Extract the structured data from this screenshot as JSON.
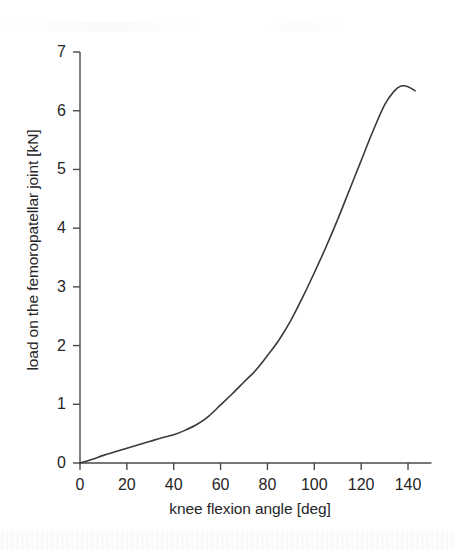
{
  "chart_data": {
    "type": "line",
    "title": "",
    "subtitle": "",
    "xlabel": "knee flexion angle [deg]",
    "ylabel": "load on the femoropatellar joint [kN]",
    "xlim": [
      0,
      150
    ],
    "ylim": [
      0,
      7
    ],
    "xticks": [
      0,
      20,
      40,
      60,
      80,
      100,
      120,
      140
    ],
    "yticks": [
      0,
      1,
      2,
      3,
      4,
      5,
      6,
      7
    ],
    "xtick_labels": [
      "0",
      "20",
      "40",
      "60",
      "80",
      "100",
      "120",
      "140"
    ],
    "ytick_labels": [
      "0",
      "1",
      "2",
      "3",
      "4",
      "5",
      "6",
      "7"
    ],
    "grid": false,
    "legend": false,
    "legend_position": "none",
    "line_color": "#3a3a3a",
    "line_width_px": 1.6,
    "axis_color": "#4a4a4a",
    "background_color": "#ffffff",
    "series": [
      {
        "name": "femoropatellar joint load",
        "x": [
          0,
          5,
          10,
          15,
          20,
          25,
          30,
          35,
          40,
          45,
          50,
          55,
          60,
          65,
          70,
          75,
          80,
          85,
          90,
          95,
          100,
          105,
          110,
          115,
          120,
          125,
          130,
          134,
          137,
          140,
          143
        ],
        "y": [
          0.0,
          0.06,
          0.13,
          0.19,
          0.25,
          0.31,
          0.37,
          0.43,
          0.48,
          0.56,
          0.66,
          0.8,
          0.99,
          1.18,
          1.38,
          1.58,
          1.83,
          2.1,
          2.43,
          2.82,
          3.24,
          3.68,
          4.15,
          4.65,
          5.15,
          5.65,
          6.1,
          6.33,
          6.42,
          6.41,
          6.34
        ]
      }
    ],
    "annotations": {
      "peak_angle_deg": 137,
      "peak_load_kn": 6.42
    }
  },
  "figure": {
    "axis_title_x": "knee flexion angle [deg]",
    "axis_title_y": "load on the femoropatellar joint [kN]"
  }
}
